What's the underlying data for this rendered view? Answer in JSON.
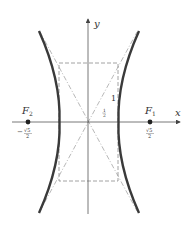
{
  "diagram": {
    "type": "hyperbola",
    "axes": {
      "x_label": "x",
      "y_label": "y"
    },
    "foci": [
      {
        "name": "F",
        "sub": "1",
        "value_label": "√5/2",
        "value_num": "√5",
        "value_den": "2",
        "sign": ""
      },
      {
        "name": "F",
        "sub": "2",
        "value_label": "−√5/2",
        "value_num": "√5",
        "value_den": "2",
        "sign": "−"
      }
    ],
    "rectangle_labels": {
      "height": "1",
      "half_width_num": "1",
      "half_width_den": "2"
    },
    "colors": {
      "curve": "#3a3a3a",
      "axes": "#555555",
      "dashed": "#888888",
      "text": "#333333"
    }
  }
}
